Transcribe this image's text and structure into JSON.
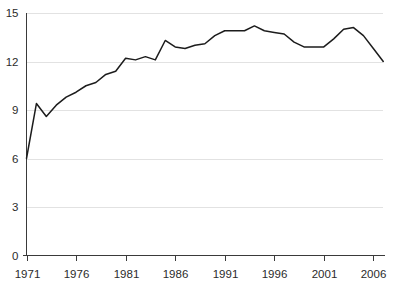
{
  "chart_data": {
    "type": "line",
    "title": "",
    "subtitle": "",
    "xlabel": "",
    "ylabel": "",
    "xlim": [
      1971,
      2007
    ],
    "ylim": [
      0,
      15
    ],
    "grid": "horizontal",
    "legend": "none",
    "y_ticks": [
      0,
      3,
      6,
      9,
      12,
      15
    ],
    "y_tick_labels": [
      "0",
      "3",
      "6",
      "9",
      "12",
      "15"
    ],
    "x_ticks": [
      1971,
      1976,
      1981,
      1986,
      1991,
      1996,
      2001,
      2006
    ],
    "x_tick_labels": [
      "1971",
      "1976",
      "1981",
      "1986",
      "1991",
      "1996",
      "2001",
      "2006"
    ],
    "line_color": "#1c1c1c",
    "grid_color": "#e2e2e2",
    "axis_color": "#3a3a3a",
    "x": [
      1971,
      1972,
      1973,
      1974,
      1975,
      1976,
      1977,
      1978,
      1979,
      1980,
      1981,
      1982,
      1983,
      1984,
      1985,
      1986,
      1987,
      1988,
      1989,
      1990,
      1991,
      1992,
      1993,
      1994,
      1995,
      1996,
      1997,
      1998,
      1999,
      2000,
      2001,
      2002,
      2003,
      2004,
      2005,
      2006,
      2007
    ],
    "values": [
      6.0,
      9.4,
      8.6,
      9.3,
      9.8,
      10.1,
      10.5,
      10.7,
      11.2,
      11.4,
      12.2,
      12.1,
      12.3,
      12.1,
      13.3,
      12.9,
      12.8,
      13.0,
      13.1,
      13.6,
      13.9,
      13.9,
      13.9,
      14.2,
      13.9,
      13.8,
      13.7,
      13.2,
      12.9,
      12.9,
      12.9,
      13.4,
      14.0,
      14.1,
      13.6,
      12.8,
      12.0
    ],
    "series": [
      {
        "name": "series-1",
        "values": [
          6.0,
          9.4,
          8.6,
          9.3,
          9.8,
          10.1,
          10.5,
          10.7,
          11.2,
          11.4,
          12.2,
          12.1,
          12.3,
          12.1,
          13.3,
          12.9,
          12.8,
          13.0,
          13.1,
          13.6,
          13.9,
          13.9,
          13.9,
          14.2,
          13.9,
          13.8,
          13.7,
          13.2,
          12.9,
          12.9,
          12.9,
          13.4,
          14.0,
          14.1,
          13.6,
          12.8,
          12.0
        ]
      }
    ]
  }
}
